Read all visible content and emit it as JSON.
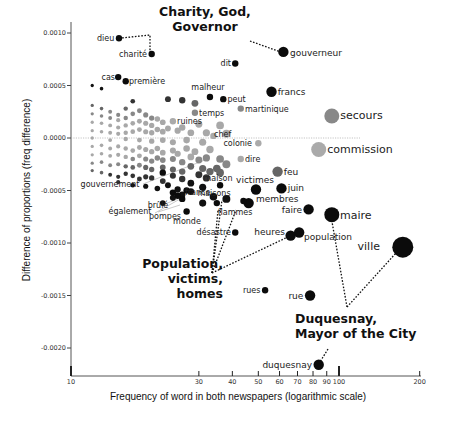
{
  "chart_data": {
    "type": "scatter",
    "title": "",
    "xlabel": "Frequency of word in both newspapers (logarithmic scale)",
    "ylabel": "Difference of proportions (freq difference)",
    "xscale": "log",
    "xlim": [
      10,
      200
    ],
    "ylim": [
      -0.00225,
      0.00112
    ],
    "xticks": [
      {
        "value": 10,
        "label": "10",
        "major": true
      },
      {
        "value": 30,
        "label": "30",
        "major": false
      },
      {
        "value": 40,
        "label": "40",
        "major": false
      },
      {
        "value": 50,
        "label": "50",
        "major": false
      },
      {
        "value": 60,
        "label": "60",
        "major": false
      },
      {
        "value": 70,
        "label": "70",
        "major": false
      },
      {
        "value": 80,
        "label": "80",
        "major": false
      },
      {
        "value": 90,
        "label": "90",
        "major": false
      },
      {
        "value": 100,
        "label": "100",
        "major": true
      },
      {
        "value": 200,
        "label": "200",
        "major": false
      }
    ],
    "yticks": [
      {
        "value": 0.001,
        "label": "0.0010"
      },
      {
        "value": 0.0005,
        "label": "0.0005"
      },
      {
        "value": 0.0,
        "label": "0.0000"
      },
      {
        "value": -0.0005,
        "label": "-0.0005"
      },
      {
        "value": -0.001,
        "label": "-0.0010"
      },
      {
        "value": -0.0015,
        "label": "-0.0015"
      },
      {
        "value": -0.002,
        "label": "-0.0020"
      }
    ],
    "zero_line": true,
    "grid": false,
    "labeled_points": [
      {
        "word": "dieu",
        "freq": 15.1,
        "diff": 0.00095,
        "label_side": "left",
        "size": "small"
      },
      {
        "word": "charité",
        "freq": 20,
        "diff": 0.0008,
        "label_side": "left",
        "size": "small"
      },
      {
        "word": "gouverneur",
        "freq": 62,
        "diff": 0.00082,
        "label_side": "right",
        "size": "medium"
      },
      {
        "word": "dit",
        "freq": 41,
        "diff": 0.00071,
        "label_side": "left",
        "size": "small"
      },
      {
        "word": "cas",
        "freq": 15,
        "diff": 0.00058,
        "label_side": "left",
        "size": "small"
      },
      {
        "word": "première",
        "freq": 16,
        "diff": 0.00054,
        "label_side": "right",
        "size": "small"
      },
      {
        "word": "malheur",
        "freq": 33,
        "diff": 0.00039,
        "label_side": "above",
        "size": "small"
      },
      {
        "word": "peut",
        "freq": 37,
        "diff": 0.00037,
        "label_side": "right",
        "size": "small"
      },
      {
        "word": "francs",
        "freq": 56,
        "diff": 0.00044,
        "label_side": "right",
        "size": "medium"
      },
      {
        "word": "temps",
        "freq": 29,
        "diff": 0.00024,
        "label_side": "right",
        "size": "small",
        "tone": "grey"
      },
      {
        "word": "martinique",
        "freq": 43,
        "diff": 0.00028,
        "label_side": "right",
        "size": "small",
        "tone": "grey"
      },
      {
        "word": "ruines",
        "freq": 24,
        "diff": 0.00016,
        "label_side": "right",
        "size": "small",
        "tone": "light"
      },
      {
        "word": "secours",
        "freq": 94,
        "diff": 0.00021,
        "label_side": "right",
        "size": "large",
        "tone": "grey"
      },
      {
        "word": "chef",
        "freq": 34,
        "diff": 2e-05,
        "label_side": "right",
        "size": "small",
        "tone": "light"
      },
      {
        "word": "colonie",
        "freq": 50,
        "diff": -5e-05,
        "label_side": "left",
        "size": "small",
        "tone": "light"
      },
      {
        "word": "commission",
        "freq": 84,
        "diff": -0.00011,
        "label_side": "right",
        "size": "large",
        "tone": "light"
      },
      {
        "word": "dire",
        "freq": 43,
        "diff": -0.0002,
        "label_side": "right",
        "size": "small",
        "tone": "light"
      },
      {
        "word": "feu",
        "freq": 59,
        "diff": -0.00032,
        "label_side": "right",
        "size": "medium",
        "tone": "dark-grey"
      },
      {
        "word": "juin",
        "freq": 61,
        "diff": -0.00048,
        "label_side": "right",
        "size": "medium"
      },
      {
        "word": "victimes",
        "freq": 49,
        "diff": -0.00049,
        "label_side": "above",
        "size": "medium"
      },
      {
        "word": "maison",
        "freq": 36,
        "diff": -0.00045,
        "label_side": "above",
        "size": "small"
      },
      {
        "word": "maisons",
        "freq": 35,
        "diff": -0.00062,
        "label_side": "above",
        "size": "small"
      },
      {
        "word": "membres",
        "freq": 46,
        "diff": -0.00062,
        "label_side": "right",
        "size": "medium"
      },
      {
        "word": "flammes",
        "freq": 44,
        "diff": -0.0006,
        "label_side": "below",
        "size": "small"
      },
      {
        "word": "france",
        "freq": 27,
        "diff": -0.0005,
        "label_side": "right",
        "size": "small"
      },
      {
        "word": "monde",
        "freq": 27,
        "diff": -0.0007,
        "label_side": "below",
        "size": "small"
      },
      {
        "word": "brûlé",
        "freq": 25,
        "diff": -0.00055,
        "label_side": "below-left",
        "size": "small"
      },
      {
        "word": "pompes",
        "freq": 26,
        "diff": -0.00058,
        "label_side": "below-left",
        "size": "small"
      },
      {
        "word": "également",
        "freq": 24,
        "diff": -0.00052,
        "label_side": "below-left",
        "size": "small"
      },
      {
        "word": "gouvernement",
        "freq": 22,
        "diff": -0.00033,
        "label_side": "left",
        "size": "small"
      },
      {
        "word": "faire",
        "freq": 77,
        "diff": -0.00068,
        "label_side": "left",
        "size": "medium"
      },
      {
        "word": "maire",
        "freq": 94,
        "diff": -0.00073,
        "label_side": "right",
        "size": "large"
      },
      {
        "word": "heures",
        "freq": 66,
        "diff": -0.00093,
        "label_side": "left",
        "size": "medium"
      },
      {
        "word": "population",
        "freq": 71,
        "diff": -0.0009,
        "label_side": "right",
        "size": "medium"
      },
      {
        "word": "désastre",
        "freq": 41,
        "diff": -0.0009,
        "label_side": "left",
        "size": "small"
      },
      {
        "word": "ville",
        "freq": 173,
        "diff": -0.00104,
        "label_side": "left",
        "size": "xlarge"
      },
      {
        "word": "rues",
        "freq": 53,
        "diff": -0.00145,
        "label_side": "left",
        "size": "small"
      },
      {
        "word": "rue",
        "freq": 78,
        "diff": -0.0015,
        "label_side": "left",
        "size": "medium"
      },
      {
        "word": "duquesnay",
        "freq": 84,
        "diff": -0.00216,
        "label_side": "left",
        "size": "medium"
      }
    ],
    "background_points_note": "Unlabeled points form a fan near the origin; low-frequency words at discrete frequencies with grey shading by |diff|.",
    "background_points": [
      {
        "freq": 12,
        "diff": 0.0005
      },
      {
        "freq": 13,
        "diff": 0.00047
      },
      {
        "freq": 12,
        "diff": 0.00031
      },
      {
        "freq": 13,
        "diff": 0.00028
      },
      {
        "freq": 14,
        "diff": 0.00025
      },
      {
        "freq": 15,
        "diff": 0.00022
      },
      {
        "freq": 16,
        "diff": 0.00028
      },
      {
        "freq": 17,
        "diff": 0.00035
      },
      {
        "freq": 12,
        "diff": 0.00023
      },
      {
        "freq": 13,
        "diff": 0.00021
      },
      {
        "freq": 14,
        "diff": 0.00019
      },
      {
        "freq": 15,
        "diff": 0.00017
      },
      {
        "freq": 16,
        "diff": 0.00019
      },
      {
        "freq": 17,
        "diff": 0.00023
      },
      {
        "freq": 18,
        "diff": 0.00026
      },
      {
        "freq": 19,
        "diff": 0.00022
      },
      {
        "freq": 20,
        "diff": 0.00019
      },
      {
        "freq": 12,
        "diff": 0.00015
      },
      {
        "freq": 13,
        "diff": 0.00014
      },
      {
        "freq": 14,
        "diff": 0.00012
      },
      {
        "freq": 15,
        "diff": 0.0001
      },
      {
        "freq": 16,
        "diff": 0.00012
      },
      {
        "freq": 17,
        "diff": 0.00014
      },
      {
        "freq": 18,
        "diff": 0.00016
      },
      {
        "freq": 19,
        "diff": 0.00014
      },
      {
        "freq": 20,
        "diff": 0.00012
      },
      {
        "freq": 21,
        "diff": 0.00018
      },
      {
        "freq": 22,
        "diff": 0.00015
      },
      {
        "freq": 12,
        "diff": 7e-05
      },
      {
        "freq": 13,
        "diff": 6e-05
      },
      {
        "freq": 14,
        "diff": 5e-05
      },
      {
        "freq": 15,
        "diff": 4e-05
      },
      {
        "freq": 16,
        "diff": 5e-05
      },
      {
        "freq": 17,
        "diff": 6e-05
      },
      {
        "freq": 18,
        "diff": 8e-05
      },
      {
        "freq": 19,
        "diff": 6e-05
      },
      {
        "freq": 20,
        "diff": 5e-05
      },
      {
        "freq": 21,
        "diff": 8e-05
      },
      {
        "freq": 22,
        "diff": 6e-05
      },
      {
        "freq": 23,
        "diff": 9e-05
      },
      {
        "freq": 25,
        "diff": 7e-05
      },
      {
        "freq": 26,
        "diff": 0.0001
      },
      {
        "freq": 28,
        "diff": 5e-05
      },
      {
        "freq": 30,
        "diff": 0.00013
      },
      {
        "freq": 32,
        "diff": 5e-05
      },
      {
        "freq": 12,
        "diff": -0.0
      },
      {
        "freq": 14,
        "diff": -2e-05
      },
      {
        "freq": 16,
        "diff": -1e-05
      },
      {
        "freq": 18,
        "diff": -2e-05
      },
      {
        "freq": 20,
        "diff": -3e-05
      },
      {
        "freq": 22,
        "diff": -2e-05
      },
      {
        "freq": 24,
        "diff": -4e-05
      },
      {
        "freq": 27,
        "diff": -2e-05
      },
      {
        "freq": 31,
        "diff": -4e-05
      },
      {
        "freq": 12,
        "diff": -8e-05
      },
      {
        "freq": 13,
        "diff": -7e-05
      },
      {
        "freq": 14,
        "diff": -0.0001
      },
      {
        "freq": 15,
        "diff": -8e-05
      },
      {
        "freq": 16,
        "diff": -0.0001
      },
      {
        "freq": 17,
        "diff": -0.00012
      },
      {
        "freq": 18,
        "diff": -9e-05
      },
      {
        "freq": 19,
        "diff": -0.00011
      },
      {
        "freq": 20,
        "diff": -0.00013
      },
      {
        "freq": 21,
        "diff": -0.0001
      },
      {
        "freq": 22,
        "diff": -0.00014
      },
      {
        "freq": 24,
        "diff": -0.00012
      },
      {
        "freq": 25,
        "diff": -0.00015
      },
      {
        "freq": 27,
        "diff": -0.0001
      },
      {
        "freq": 29,
        "diff": -0.00013
      },
      {
        "freq": 33,
        "diff": -0.00011
      },
      {
        "freq": 12,
        "diff": -0.00016
      },
      {
        "freq": 13,
        "diff": -0.00015
      },
      {
        "freq": 14,
        "diff": -0.00017
      },
      {
        "freq": 15,
        "diff": -0.00016
      },
      {
        "freq": 16,
        "diff": -0.00018
      },
      {
        "freq": 17,
        "diff": -0.0002
      },
      {
        "freq": 18,
        "diff": -0.00017
      },
      {
        "freq": 19,
        "diff": -0.0002
      },
      {
        "freq": 20,
        "diff": -0.00022
      },
      {
        "freq": 21,
        "diff": -0.00019
      },
      {
        "freq": 22,
        "diff": -0.00021
      },
      {
        "freq": 24,
        "diff": -0.0002
      },
      {
        "freq": 26,
        "diff": -0.00023
      },
      {
        "freq": 28,
        "diff": -0.00018
      },
      {
        "freq": 30,
        "diff": -0.00021
      },
      {
        "freq": 32,
        "diff": -0.00019
      },
      {
        "freq": 12,
        "diff": -0.00024
      },
      {
        "freq": 13,
        "diff": -0.00023
      },
      {
        "freq": 14,
        "diff": -0.00026
      },
      {
        "freq": 15,
        "diff": -0.00025
      },
      {
        "freq": 16,
        "diff": -0.00027
      },
      {
        "freq": 17,
        "diff": -0.00028
      },
      {
        "freq": 18,
        "diff": -0.00026
      },
      {
        "freq": 19,
        "diff": -0.00028
      },
      {
        "freq": 20,
        "diff": -0.0003
      },
      {
        "freq": 22,
        "diff": -0.00028
      },
      {
        "freq": 24,
        "diff": -0.0003
      },
      {
        "freq": 26,
        "diff": -0.00032
      },
      {
        "freq": 28,
        "diff": -0.00027
      },
      {
        "freq": 31,
        "diff": -0.00029
      },
      {
        "freq": 12,
        "diff": -0.00031
      },
      {
        "freq": 13,
        "diff": -0.00033
      },
      {
        "freq": 14,
        "diff": -0.00035
      },
      {
        "freq": 15,
        "diff": -0.00037
      },
      {
        "freq": 16,
        "diff": -0.00034
      },
      {
        "freq": 17,
        "diff": -0.00036
      },
      {
        "freq": 18,
        "diff": -0.00039
      },
      {
        "freq": 19,
        "diff": -0.00037
      },
      {
        "freq": 20,
        "diff": -0.00038
      },
      {
        "freq": 22,
        "diff": -0.00041
      },
      {
        "freq": 24,
        "diff": -0.00036
      },
      {
        "freq": 26,
        "diff": -0.00039
      },
      {
        "freq": 28,
        "diff": -0.00043
      },
      {
        "freq": 30,
        "diff": -0.00035
      },
      {
        "freq": 32,
        "diff": -0.00038
      },
      {
        "freq": 15,
        "diff": -0.00042
      },
      {
        "freq": 17,
        "diff": -0.00045
      },
      {
        "freq": 19,
        "diff": -0.00046
      },
      {
        "freq": 21,
        "diff": -0.00048
      },
      {
        "freq": 23,
        "diff": -0.00045
      },
      {
        "freq": 25,
        "diff": -0.00049
      },
      {
        "freq": 28,
        "diff": -0.00051
      },
      {
        "freq": 31,
        "diff": -0.00047
      },
      {
        "freq": 34,
        "diff": -0.00056
      },
      {
        "freq": 38,
        "diff": -0.00058
      },
      {
        "freq": 31,
        "diff": -0.00062
      },
      {
        "freq": 24,
        "diff": -0.00057
      },
      {
        "freq": 26,
        "diff": -0.00054
      },
      {
        "freq": 22,
        "diff": -0.00062
      },
      {
        "freq": 26,
        "diff": 0.00036
      },
      {
        "freq": 29,
        "diff": 0.00033
      },
      {
        "freq": 23,
        "diff": 0.00037
      },
      {
        "freq": 36,
        "diff": 0.00012
      },
      {
        "freq": 38,
        "diff": 4e-05
      },
      {
        "freq": 36,
        "diff": -0.0002
      },
      {
        "freq": 38,
        "diff": -0.00025
      },
      {
        "freq": 35,
        "diff": -0.00029
      },
      {
        "freq": 33,
        "diff": -0.00032
      },
      {
        "freq": 36,
        "diff": -0.00033
      }
    ],
    "annotations": [
      {
        "text_lines": [
          "Charity, God,",
          "Governor"
        ],
        "points_to": [
          "dieu",
          "charité",
          "gouverneur"
        ],
        "align": "center"
      },
      {
        "text_lines": [
          "Population,",
          "victims,",
          "homes"
        ],
        "points_to": [
          "maison",
          "maisons",
          "membres",
          "population"
        ],
        "align": "right"
      },
      {
        "text_lines": [
          "Duquesnay,",
          "Mayor of the City"
        ],
        "points_to": [
          "maire",
          "ville",
          "duquesnay"
        ],
        "align": "left"
      }
    ]
  },
  "caption_partial": "Difference of ... (cropped)"
}
